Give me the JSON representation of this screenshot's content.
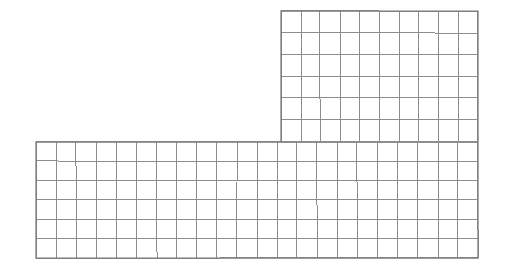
{
  "figure": {
    "kind": "grid-diagram",
    "background_color": "#ffffff",
    "line_color": "#8d8d8d",
    "outline_color": "#7a7a7a",
    "canvas": {
      "width": 506,
      "height": 275
    }
  },
  "chart_data": {
    "type": "heatmap",
    "title": "",
    "xlabel": "",
    "ylabel": "",
    "grid": true,
    "legend_position": "none",
    "cell_width": 19.7,
    "cell_height": 21.8,
    "total_cells": 192,
    "blocks": [
      {
        "name": "upper-right-block",
        "columns": 10,
        "rows": 6,
        "cells": 60,
        "x0": 281,
        "y0": 11,
        "x1": 478,
        "y1": 142
      },
      {
        "name": "lower-full-width-block",
        "columns": 22,
        "rows": 6,
        "cells": 132,
        "x0": 36,
        "y0": 142,
        "x1": 478,
        "y1": 258
      }
    ],
    "outline_vertices": [
      [
        281,
        11
      ],
      [
        478,
        11
      ],
      [
        478,
        258
      ],
      [
        36,
        258
      ],
      [
        36,
        142
      ],
      [
        281,
        142
      ]
    ]
  }
}
